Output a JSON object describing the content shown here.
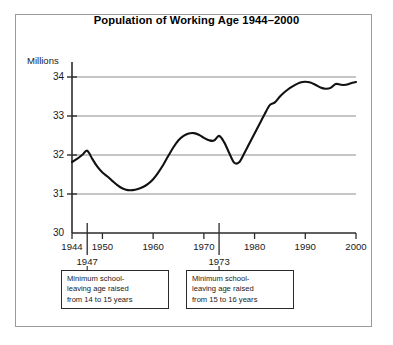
{
  "chart_data": {
    "type": "line",
    "title": "Population of Working Age 1944–2000",
    "xlabel": "",
    "ylabel": "Millions",
    "ylim": [
      30,
      34
    ],
    "xlim": [
      1944,
      2000
    ],
    "yticks": [
      "30",
      "31",
      "32",
      "33",
      "34"
    ],
    "xticks": [
      "1944",
      "1950",
      "1960",
      "1970",
      "1980",
      "1990",
      "2000"
    ],
    "grid": true,
    "legend": "none",
    "series": [
      {
        "name": "Population of working age (millions)",
        "x": [
          1944,
          1945,
          1946,
          1947,
          1948,
          1949,
          1950,
          1951,
          1952,
          1953,
          1954,
          1955,
          1956,
          1957,
          1958,
          1959,
          1960,
          1961,
          1962,
          1963,
          1964,
          1965,
          1966,
          1967,
          1968,
          1969,
          1970,
          1971,
          1972,
          1973,
          1974,
          1975,
          1976,
          1977,
          1978,
          1979,
          1980,
          1981,
          1982,
          1983,
          1984,
          1985,
          1986,
          1987,
          1988,
          1989,
          1990,
          1991,
          1992,
          1993,
          1994,
          1995,
          1996,
          1997,
          1998,
          1999,
          2000
        ],
        "y": [
          31.82,
          31.9,
          32.0,
          32.11,
          31.9,
          31.7,
          31.55,
          31.45,
          31.33,
          31.22,
          31.14,
          31.1,
          31.1,
          31.13,
          31.18,
          31.26,
          31.38,
          31.55,
          31.75,
          31.98,
          32.2,
          32.38,
          32.49,
          32.55,
          32.56,
          32.52,
          32.44,
          32.38,
          32.37,
          32.49,
          32.33,
          32.05,
          31.8,
          31.82,
          32.05,
          32.3,
          32.55,
          32.8,
          33.05,
          33.28,
          33.35,
          33.5,
          33.62,
          33.72,
          33.8,
          33.86,
          33.88,
          33.86,
          33.8,
          33.73,
          33.7,
          33.72,
          33.82,
          33.8,
          33.8,
          33.84,
          33.87
        ]
      }
    ],
    "annotations": [
      {
        "year_label": "1947",
        "year_value": 1947,
        "lines": [
          "Minimum school-",
          "leaving age raised",
          "from 14 to 15 years"
        ]
      },
      {
        "year_label": "1973",
        "year_value": 1973,
        "lines": [
          "Minimum school-",
          "leaving age raised",
          "from 15 to 16 years"
        ]
      }
    ]
  },
  "style": {
    "line_color": "#111111",
    "grid_color": "#8d8d8d",
    "axis_color": "#2b2b2b",
    "border_color": "#9a9a9a",
    "text_color": "#1a1a1a"
  }
}
